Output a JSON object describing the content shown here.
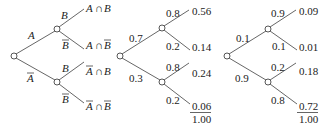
{
  "trees": [
    {
      "first_branches": [
        {
          "label": "A",
          "bar": false
        },
        {
          "label": "A",
          "bar": true
        }
      ],
      "second_branches": [
        {
          "label": "B",
          "bar": false
        },
        {
          "label": "B",
          "bar": true
        },
        {
          "label": "B",
          "bar": false
        },
        {
          "label": "B",
          "bar": true
        }
      ],
      "outcomes": [
        {
          "a": "A",
          "a_bar": false,
          "op": "∩",
          "b": "B",
          "b_bar": false
        },
        {
          "a": "A",
          "a_bar": false,
          "op": "∩",
          "b": "B",
          "b_bar": true
        },
        {
          "a": "A",
          "a_bar": true,
          "op": "∩",
          "b": "B",
          "b_bar": false
        },
        {
          "a": "A",
          "a_bar": true,
          "op": "∩",
          "b": "B",
          "b_bar": true
        }
      ]
    },
    {
      "first_branches": [
        "0.7",
        "0.3"
      ],
      "second_branches": [
        "0.8",
        "0.2",
        "0.8",
        "0.2"
      ],
      "outcomes": [
        "0.56",
        "0.14",
        "0.24",
        "0.06"
      ],
      "total": "1.00"
    },
    {
      "first_branches": [
        "0.1",
        "0.9"
      ],
      "second_branches": [
        "0.9",
        "0.1",
        "0.2",
        "0.8"
      ],
      "outcomes": [
        "0.09",
        "0.01",
        "0.18",
        "0.72"
      ],
      "total": "1.00"
    }
  ]
}
